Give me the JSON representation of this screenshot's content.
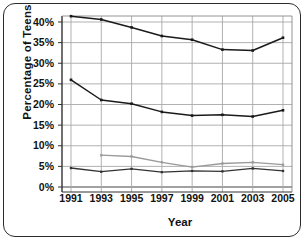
{
  "chart_data": {
    "type": "line",
    "title": "",
    "xlabel": "Year",
    "ylabel": "Percentage of Teens",
    "x": [
      1991,
      1993,
      1995,
      1997,
      1999,
      2001,
      2003,
      2005
    ],
    "xtick_labels": [
      "1991",
      "1993",
      "1995",
      "1997",
      "1999",
      "2001",
      "2003",
      "2005"
    ],
    "ytick_labels": [
      "0%",
      "5%",
      "10%",
      "15%",
      "20%",
      "25%",
      "30%",
      "35%",
      "40%"
    ],
    "ytick_values": [
      0,
      5,
      10,
      15,
      20,
      25,
      30,
      35,
      40
    ],
    "ylim": [
      0,
      42
    ],
    "xlim": [
      1990.4,
      2005.6
    ],
    "grid": true,
    "legend": "none",
    "series": [
      {
        "name": "series-1-upper",
        "color": "#1a1a1a",
        "marker": "square",
        "values": [
          41.4,
          40.6,
          38.7,
          36.6,
          35.7,
          33.3,
          33.1,
          36.2
        ]
      },
      {
        "name": "series-2-middle",
        "color": "#1a1a1a",
        "marker": "square",
        "values": [
          26.0,
          21.1,
          20.2,
          18.2,
          17.3,
          17.5,
          17.1,
          18.6
        ]
      },
      {
        "name": "series-3-lower-gray",
        "color": "#9a9a9a",
        "marker": "square",
        "values": [
          null,
          7.7,
          7.4,
          6.0,
          4.8,
          5.7,
          6.0,
          5.4
        ]
      },
      {
        "name": "series-4-lowest-dark",
        "color": "#333333",
        "marker": "square",
        "values": [
          4.6,
          3.7,
          4.4,
          3.6,
          3.9,
          3.8,
          4.5,
          3.9
        ]
      }
    ]
  }
}
